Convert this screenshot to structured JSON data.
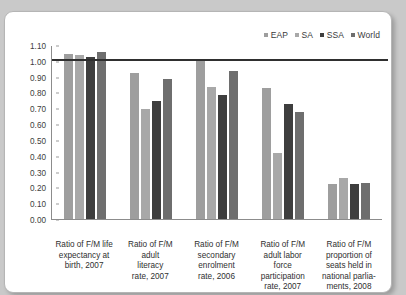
{
  "chart_data": {
    "type": "bar",
    "title": "",
    "xlabel": "",
    "ylabel": "",
    "ylim": [
      0.0,
      1.1
    ],
    "grid": false,
    "legend_position": "top-right",
    "reference_line": 1.0,
    "y_ticks": [
      "1.10",
      "1.00",
      "0.90",
      "0.80",
      "0.70",
      "0.60",
      "0.50",
      "0.40",
      "0.30",
      "0.20",
      "0.10",
      "0.00"
    ],
    "y_tick_values": [
      1.1,
      1.0,
      0.9,
      0.8,
      0.7,
      0.6,
      0.5,
      0.4,
      0.3,
      0.2,
      0.1,
      0.0
    ],
    "categories": [
      "Ratio of F/M life expectancy at birth, 2007",
      "Ratio of F/M adult literacy rate, 2007",
      "Ratio of F/M secondary enrolment rate, 2006",
      "Ratio of F/M adult labor force participation rate, 2007",
      "Ratio of F/M proportion of seats held in national parlia-ments, 2008"
    ],
    "category_lines": [
      [
        "Ratio of F/M life",
        "expectancy at",
        "birth, 2007"
      ],
      [
        "Ratio of F/M",
        "adult",
        "literacy",
        "rate, 2007"
      ],
      [
        "Ratio of F/M",
        "secondary",
        "enrolment",
        "rate, 2006"
      ],
      [
        "Ratio of F/M",
        "adult labor",
        "force",
        "participation",
        "rate, 2007"
      ],
      [
        "Ratio of F/M",
        "proportion of",
        "seats held in",
        "national parlia-",
        "ments, 2008"
      ]
    ],
    "series": [
      {
        "name": "EAP",
        "color": "#9e9e9e",
        "values": [
          1.05,
          0.93,
          1.01,
          0.83,
          0.22
        ]
      },
      {
        "name": "SA",
        "color": "#a8a8a8",
        "values": [
          1.04,
          0.7,
          0.84,
          0.42,
          0.26
        ]
      },
      {
        "name": "SSA",
        "color": "#3e3e3e",
        "values": [
          1.03,
          0.75,
          0.79,
          0.73,
          0.22
        ]
      },
      {
        "name": "World",
        "color": "#6e6e6e",
        "values": [
          1.06,
          0.89,
          0.94,
          0.68,
          0.23
        ]
      }
    ]
  },
  "legend": {
    "items": [
      {
        "label": "EAP",
        "color": "#9e9e9e"
      },
      {
        "label": "SA",
        "color": "#a8a8a8"
      },
      {
        "label": "SSA",
        "color": "#3e3e3e"
      },
      {
        "label": "World",
        "color": "#6e6e6e"
      }
    ]
  }
}
